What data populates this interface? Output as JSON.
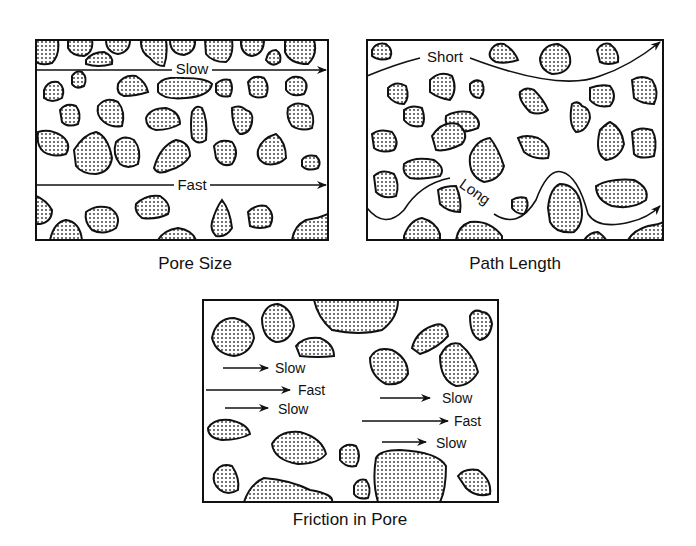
{
  "panels": [
    {
      "id": "pore-size",
      "caption": "Pore Size",
      "labels": {
        "top_arrow": "Slow",
        "bottom_arrow": "Fast"
      }
    },
    {
      "id": "path-length",
      "caption": "Path Length",
      "labels": {
        "top_path": "Short",
        "bottom_path": "Long"
      }
    },
    {
      "id": "friction-in-pore",
      "caption": "Friction in Pore",
      "labels": {
        "left": [
          "Slow",
          "Fast",
          "Slow"
        ],
        "right": [
          "Slow",
          "Fast",
          "Slow"
        ]
      }
    }
  ],
  "colors": {
    "ink": "#111111",
    "background": "#ffffff"
  }
}
